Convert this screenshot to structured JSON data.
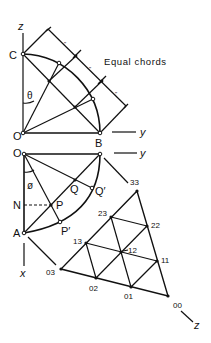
{
  "top_figure": {
    "axis_z": "z",
    "axis_y": "y",
    "point_C": "C",
    "point_O": "O",
    "point_B": "B",
    "angle_theta": "θ",
    "caption": "Equal chords",
    "tick_mark": "\""
  },
  "bottom_figure": {
    "axis_y": "y",
    "axis_x": "x",
    "point_O": "O",
    "point_N": "N",
    "point_A": "A",
    "point_P": "P",
    "point_P_prime": "P′",
    "point_Q": "Q",
    "point_Q_prime": "Q′",
    "angle_phi": "ø"
  },
  "grid": {
    "axis_z": "z",
    "labels": [
      "33",
      "23",
      "22",
      "13",
      "12",
      "11",
      "03",
      "02",
      "01",
      "00"
    ]
  },
  "colors": {
    "ink": "#111111",
    "background": "#ffffff"
  }
}
